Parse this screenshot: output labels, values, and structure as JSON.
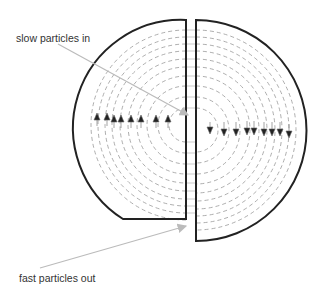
{
  "diagram": {
    "labels": {
      "input": "slow particles in",
      "output": "fast particles out"
    },
    "colors": {
      "dee_outline": "#222222",
      "orbit_dash": "#999999",
      "pointer_line": "#bbbbbb",
      "arrow": "#222222",
      "text": "#333333"
    },
    "arrows_up_x": [
      97,
      107,
      114,
      121,
      131,
      141,
      156,
      168
    ],
    "arrows_down_x": [
      210,
      224,
      236,
      247,
      254,
      264,
      272,
      280,
      289
    ]
  }
}
